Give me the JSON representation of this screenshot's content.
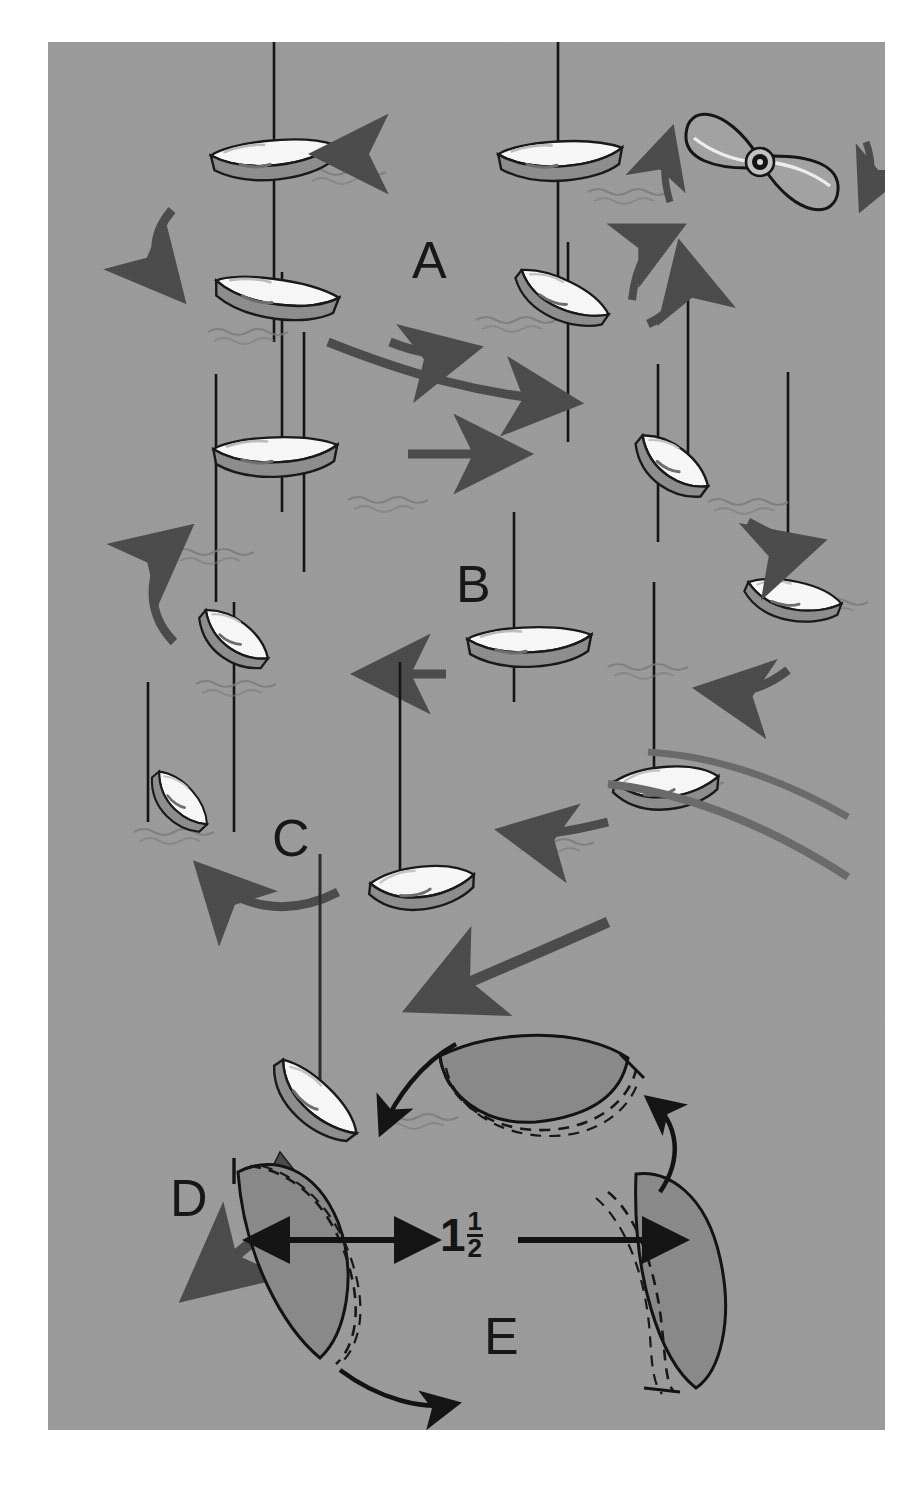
{
  "figure": {
    "background_color": "#9c9c9c",
    "page_color": "#ffffff",
    "ink_color": "#141414",
    "arrow_color": "#4a4a4a",
    "hull_white": "#fbfbfb",
    "hull_shadow": "#8e8e8e",
    "blade_fill": "#8a8a8a"
  },
  "labels": {
    "a": "A",
    "b": "B",
    "c": "C",
    "d": "D",
    "e": "E"
  },
  "dimension": {
    "whole": "1",
    "numerator": "1",
    "denominator": "2",
    "full_text": "1 1/2"
  },
  "icons": {
    "propeller": "propeller-icon",
    "rotation_up": "rotation-arrow-up-icon",
    "rotation_down": "rotation-arrow-down-icon",
    "blade_detail": "propeller-blade-detail-icon"
  },
  "diagram_data": {
    "type": "illustration",
    "panels": [
      {
        "id": "A",
        "label": "A",
        "description": "Tight circular turn sequence, four boat positions going counter-clockwise",
        "boat_count": 4,
        "arrow_count": 4,
        "label_x": 412,
        "label_y": 218
      },
      {
        "id": "B",
        "label": "B",
        "description": "Wider circular turn sequence, six boat positions",
        "boat_count": 6,
        "arrow_count": 6,
        "label_x": 455,
        "label_y": 545
      },
      {
        "id": "C",
        "label": "C",
        "description": "Turn completion into straight run, three boat positions",
        "boat_count": 3,
        "arrow_count": 3,
        "label_x": 272,
        "label_y": 800
      },
      {
        "id": "D",
        "label": "D",
        "description": "Departure heading with long straight arrow",
        "boat_count": 1,
        "arrow_count": 1,
        "label_x": 170,
        "label_y": 1160
      },
      {
        "id": "E",
        "label": "E",
        "description": "Three-bladed propeller detail with blade pitch dimension",
        "blade_count": 3,
        "dimension_label": "1 1/2",
        "label_x": 483,
        "label_y": 1295
      }
    ],
    "propeller_icon": {
      "blades": 2,
      "rotation_arrows": [
        "up-left",
        "down-right",
        "up-from-below"
      ],
      "x": 760,
      "y": 155
    }
  }
}
